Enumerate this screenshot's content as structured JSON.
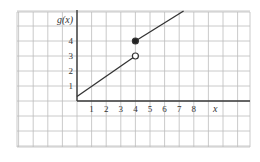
{
  "chart_data": {
    "type": "line",
    "title": "",
    "xlabel": "x",
    "ylabel": "g(x)",
    "x_ticks": [
      "1",
      "2",
      "3",
      "4",
      "5",
      "6",
      "7",
      "8"
    ],
    "y_ticks": [
      "1",
      "2",
      "3",
      "4"
    ],
    "grid": true,
    "xlim": [
      -4,
      11.8
    ],
    "ylim": [
      -3,
      6
    ],
    "series": [
      {
        "name": "segment-left",
        "points": [
          [
            0,
            0.3
          ],
          [
            4,
            3
          ]
        ],
        "end_marker": "open"
      },
      {
        "name": "segment-right",
        "points": [
          [
            4,
            4
          ],
          [
            7.3,
            6
          ]
        ],
        "start_marker": "closed"
      }
    ],
    "points": [
      {
        "x": 4,
        "y": 3,
        "style": "open-circle"
      },
      {
        "x": 4,
        "y": 4,
        "style": "filled-circle"
      }
    ]
  },
  "labels": {
    "y_axis": "g(x)",
    "x_axis": "x"
  }
}
